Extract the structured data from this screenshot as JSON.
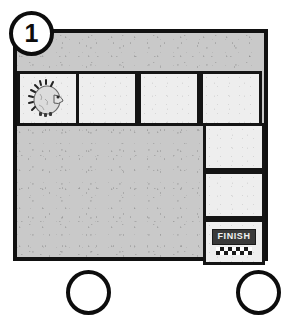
{
  "puzzle": {
    "level_badge": "1",
    "board": {
      "background_color": "#c9c9c9",
      "border_color": "#111111",
      "tile_color": "#eeeeee"
    },
    "path_tiles": [
      {
        "id": "tile-r0c0",
        "row": 0,
        "col": 0,
        "content": "hedgehog",
        "label": ""
      },
      {
        "id": "tile-r0c1",
        "row": 0,
        "col": 1,
        "content": "empty",
        "label": ""
      },
      {
        "id": "tile-r0c2",
        "row": 0,
        "col": 2,
        "content": "empty",
        "label": ""
      },
      {
        "id": "tile-r0c3",
        "row": 0,
        "col": 3,
        "content": "empty",
        "label": ""
      },
      {
        "id": "tile-r1c3",
        "row": 1,
        "col": 3,
        "content": "empty",
        "label": ""
      },
      {
        "id": "tile-r2c3",
        "row": 2,
        "col": 3,
        "content": "empty",
        "label": ""
      },
      {
        "id": "tile-r3c3",
        "row": 3,
        "col": 3,
        "content": "finish",
        "label": "FINISH"
      }
    ],
    "start_marker": {
      "icon": "hedgehog-icon",
      "name": "hedgehog"
    },
    "finish_marker": {
      "icon": "finish-sign-icon",
      "label": "FINISH",
      "plate_bg": "#3a3a3a",
      "plate_text_color": "#f2f2f2",
      "checker_colors": [
        "#1b1b1b",
        "#ffffff"
      ]
    },
    "next_badges": [
      {
        "id": "peek-badge-left",
        "label": ""
      },
      {
        "id": "peek-badge-right",
        "label": ""
      }
    ]
  }
}
